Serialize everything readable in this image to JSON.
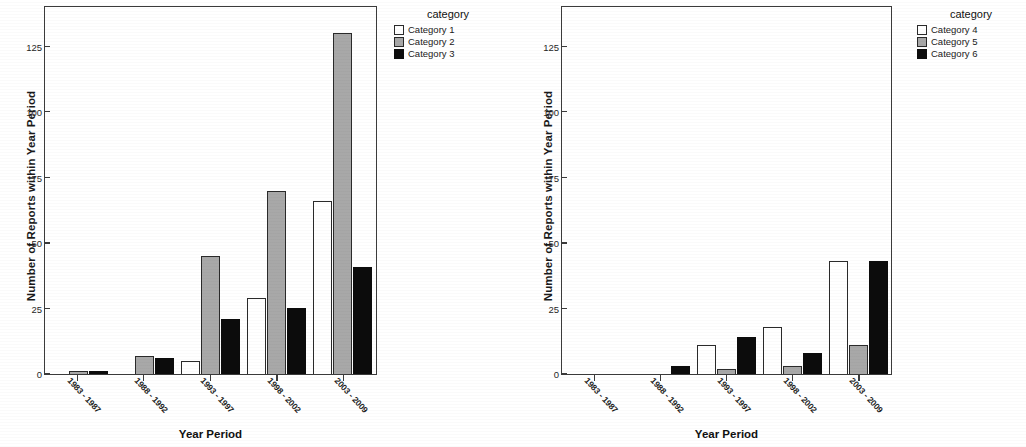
{
  "chart_data": [
    {
      "type": "bar",
      "panel": "left",
      "title": "",
      "xlabel": "Year Period",
      "ylabel": "Number of Reports within Year Period",
      "legend_title": "category",
      "legend_position": "right",
      "grid": false,
      "ylim": [
        0,
        140
      ],
      "yticks": [
        0,
        25,
        50,
        75,
        100,
        125
      ],
      "categories": [
        "1983 - 1987",
        "1988 - 1992",
        "1993 - 1997",
        "1998 - 2002",
        "2003 - 2009"
      ],
      "series": [
        {
          "name": "Category 1",
          "color": "#ffffff",
          "values": [
            0,
            0,
            5,
            29,
            66
          ]
        },
        {
          "name": "Category 2",
          "color": "#a8a8a8",
          "values": [
            1,
            7,
            45,
            70,
            130
          ]
        },
        {
          "name": "Category 3",
          "color": "#0c0c0c",
          "values": [
            1,
            6,
            21,
            25,
            41
          ]
        }
      ]
    },
    {
      "type": "bar",
      "panel": "right",
      "title": "",
      "xlabel": "Year Period",
      "ylabel": "Number of Reports within Year Period",
      "legend_title": "category",
      "legend_position": "right",
      "grid": false,
      "ylim": [
        0,
        140
      ],
      "yticks": [
        0,
        25,
        50,
        75,
        100,
        125
      ],
      "categories": [
        "1983 - 1987",
        "1988 - 1992",
        "1993 - 1997",
        "1998 - 2002",
        "2003 - 2009"
      ],
      "series": [
        {
          "name": "Category 4",
          "color": "#ffffff",
          "values": [
            0,
            0,
            11,
            18,
            43
          ]
        },
        {
          "name": "Category 5",
          "color": "#a8a8a8",
          "values": [
            0,
            0,
            2,
            3,
            11
          ]
        },
        {
          "name": "Category 6",
          "color": "#0c0c0c",
          "values": [
            0,
            3,
            14,
            8,
            43
          ]
        }
      ]
    }
  ],
  "left_panel": {
    "ylabel": "Number of Reports within Year Period",
    "xlabel": "Year Period",
    "legend_title": "category",
    "yticks": [
      "125",
      "100",
      "75",
      "50",
      "25",
      "0"
    ],
    "xticks": [
      "1983 - 1987",
      "1988 - 1992",
      "1993 - 1997",
      "1998 - 2002",
      "2003 - 2009"
    ],
    "legend_items": [
      "Category 1",
      "Category 2",
      "Category 3"
    ]
  },
  "right_panel": {
    "ylabel": "Number of Reports within Year Period",
    "xlabel": "Year Period",
    "legend_title": "category",
    "yticks": [
      "125",
      "100",
      "75",
      "50",
      "25",
      "0"
    ],
    "xticks": [
      "1983 - 1987",
      "1988 - 1992",
      "1993 - 1997",
      "1998 - 2002",
      "2003 - 2009"
    ],
    "legend_items": [
      "Category 4",
      "Category 5",
      "Category 6"
    ]
  }
}
